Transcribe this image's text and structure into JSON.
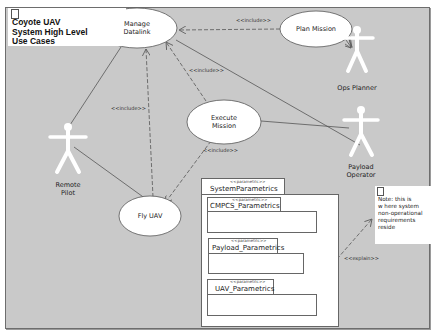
{
  "diagram": {
    "type": "UML use case diagram",
    "title": "Coyote UAV\nSystem High Level\nUse Cases",
    "use_cases": [
      {
        "id": "manage-datalink",
        "label": "Manage\nDatalink"
      },
      {
        "id": "plan-mission",
        "label": "Plan Mission"
      },
      {
        "id": "execute-mission",
        "label": "Execute\nMission"
      },
      {
        "id": "fly-uav",
        "label": "Fly UAV"
      }
    ],
    "actors": [
      {
        "id": "ops-planner",
        "label": "Ops Planner"
      },
      {
        "id": "remote-pilot",
        "label": "Remote\nPilot"
      },
      {
        "id": "payload-operator",
        "label": "Payload\nOperator"
      }
    ],
    "relationships": [
      {
        "from": "plan-mission",
        "to": "manage-datalink",
        "stereotype": "<<include>>"
      },
      {
        "from": "execute-mission",
        "to": "manage-datalink",
        "stereotype": "<<include>>"
      },
      {
        "from": "fly-uav",
        "to": "manage-datalink",
        "stereotype": "<<include>>"
      },
      {
        "from": "execute-mission",
        "to": "fly-uav",
        "stereotype": "<<include>>"
      },
      {
        "from": "package-systemparametrics",
        "to": "note",
        "stereotype": "<<explain>>"
      }
    ],
    "associations": [
      {
        "actor": "ops-planner",
        "use_case": "plan-mission"
      },
      {
        "actor": "payload-operator",
        "use_case": "manage-datalink"
      },
      {
        "actor": "payload-operator",
        "use_case": "execute-mission"
      },
      {
        "actor": "remote-pilot",
        "use_case": "manage-datalink"
      },
      {
        "actor": "remote-pilot",
        "use_case": "fly-uav"
      }
    ],
    "labels": {
      "include_1": "<<include>>",
      "include_2": "<<include>>",
      "include_3": "<<include>>",
      "include_4": "<<include>>",
      "explain": "<<explain>>"
    },
    "package": {
      "stereotype": "<<parametric>>",
      "name": "SystemParametrics",
      "children": [
        {
          "stereotype": "<<parametric>>",
          "name": "CMPCS_Parametrics"
        },
        {
          "stereotype": "<<parametric>>",
          "name": "Payload_Parametrics"
        },
        {
          "stereotype": "<<parametric>>",
          "name": "UAV_Parametrics"
        }
      ]
    },
    "note": "Note: this is\nw here system\nnon-operational\nrequirements\nreside",
    "colors": {
      "background": "#c9c9c9",
      "shape_fill": "#ffffff",
      "line": "#555555"
    }
  }
}
